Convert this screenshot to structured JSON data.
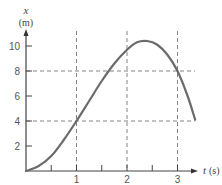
{
  "chart_data": {
    "type": "line",
    "title": "",
    "xlabel": "t (s)",
    "ylabel": "x (m)",
    "x_symbol": "t",
    "x_unit": "(s)",
    "y_symbol": "x",
    "y_unit": "(m)",
    "xlim": [
      0,
      3.4
    ],
    "ylim": [
      0,
      11
    ],
    "x_ticks": [
      0.5,
      1,
      1.5,
      2,
      2.5,
      3
    ],
    "x_tick_labels": [
      "",
      "1",
      "",
      "2",
      "",
      "3"
    ],
    "y_ticks": [
      2,
      4,
      6,
      8,
      10
    ],
    "y_tick_labels": [
      "2",
      "4",
      "6",
      "8",
      "10"
    ],
    "grid": false,
    "legend": null,
    "series": [
      {
        "name": "x(t)",
        "color": "#6b6b6b",
        "points": [
          [
            0,
            0
          ],
          [
            0.25,
            0.4
          ],
          [
            0.5,
            1.2
          ],
          [
            0.75,
            2.5
          ],
          [
            1.0,
            4.0
          ],
          [
            1.25,
            5.6
          ],
          [
            1.5,
            7.2
          ],
          [
            1.75,
            8.6
          ],
          [
            2.0,
            9.7
          ],
          [
            2.2,
            10.3
          ],
          [
            2.4,
            10.4
          ],
          [
            2.6,
            10.1
          ],
          [
            2.8,
            9.3
          ],
          [
            3.0,
            8.0
          ],
          [
            3.2,
            6.0
          ],
          [
            3.35,
            4.1
          ]
        ]
      }
    ],
    "reference_lines": {
      "vertical": [
        {
          "x": 1,
          "label": "t = 1 s"
        },
        {
          "x": 2,
          "label": "t = 2 s"
        },
        {
          "x": 3,
          "label": "t = 3 s"
        }
      ],
      "horizontal": [
        {
          "y": 4,
          "label": "x = 4 m"
        },
        {
          "y": 8,
          "label": "x = 8 m"
        }
      ]
    },
    "annotations": []
  }
}
